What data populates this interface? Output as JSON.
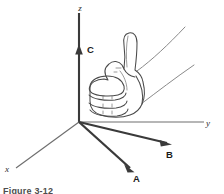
{
  "figure": {
    "caption": "Figure 3-12",
    "background_color": "#ffffff",
    "ink_color": "#3a3a3a"
  },
  "axes": [
    {
      "id": "z",
      "label": "z",
      "label_x": 80,
      "label_y": 11,
      "description": "vertical axis pointing up"
    },
    {
      "id": "y",
      "label": "y",
      "label_x": 208,
      "label_y": 126,
      "description": "horizontal axis pointing right"
    },
    {
      "id": "x",
      "label": "x",
      "label_x": 6,
      "label_y": 172,
      "description": "oblique axis pointing to lower left"
    }
  ],
  "vectors": [
    {
      "id": "C",
      "label": "C",
      "label_x": 87,
      "label_y": 53,
      "direction": "up along z axis",
      "color": "#3a3a3a"
    },
    {
      "id": "B",
      "label": "B",
      "label_x": 168,
      "label_y": 157,
      "direction": "lower right toward viewer",
      "color": "#3a3a3a"
    },
    {
      "id": "A",
      "label": "A",
      "label_x": 134,
      "label_y": 179,
      "direction": "down and right toward viewer",
      "color": "#3a3a3a"
    }
  ],
  "hand": {
    "name": "right-hand-thumbs-up",
    "thumb": "pointing up along z / vector C",
    "fingers": "curled, four knuckle bands",
    "wrist": "two thin lines extending to upper right"
  }
}
